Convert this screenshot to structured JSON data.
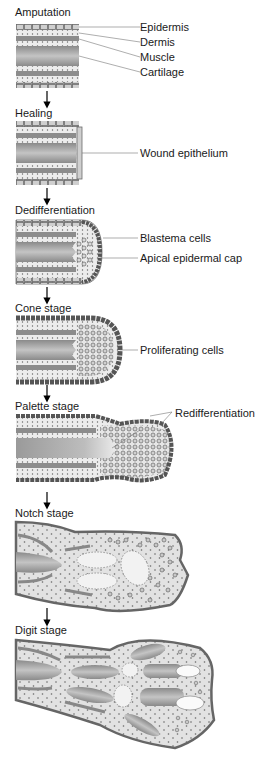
{
  "diagram": {
    "type": "biological-process-sequence",
    "stages": [
      {
        "title": "Amputation",
        "labels": [
          "Epidermis",
          "Dermis",
          "Muscle",
          "Cartilage"
        ]
      },
      {
        "title": "Healing",
        "labels": [
          "Wound epithelium"
        ]
      },
      {
        "title": "Dedifferentiation",
        "labels": [
          "Blastema cells",
          "Apical epidermal cap"
        ]
      },
      {
        "title": "Cone stage",
        "labels": [
          "Proliferating cells"
        ]
      },
      {
        "title": "Palette stage",
        "labels": [
          "Redifferentiation"
        ]
      },
      {
        "title": "Notch stage",
        "labels": []
      },
      {
        "title": "Digit stage",
        "labels": []
      }
    ],
    "colors": {
      "epidermis": "#c8c8c8",
      "epidermis_border": "#6b6b6b",
      "dermis": "#e6e6e6",
      "muscle": "#8c8c8c",
      "cartilage": "#9a9a9a",
      "tissue_fill": "#e4e4e4",
      "outline": "#555555",
      "arrow": "#000000"
    }
  }
}
